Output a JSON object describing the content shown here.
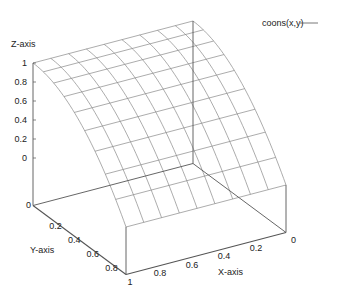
{
  "chart_data": {
    "type": "surface",
    "title": "",
    "xlabel": "X-axis",
    "ylabel": "Y-axis",
    "zlabel": "Z-axis",
    "legend": [
      {
        "name": "coons(x,y)",
        "style": "line",
        "color": "#333333"
      }
    ],
    "legend_position": "top-right",
    "xlim": [
      0,
      1
    ],
    "ylim": [
      0,
      1
    ],
    "zlim": [
      -0.5,
      1
    ],
    "x_ticks": [
      "0",
      "0.2",
      "0.4",
      "0.6",
      "0.8",
      "1"
    ],
    "y_ticks": [
      "0",
      "0.2",
      "0.4",
      "0.6",
      "0.8",
      "1"
    ],
    "z_ticks": [
      "0",
      "0.2",
      "0.4",
      "0.6",
      "0.8",
      "1"
    ],
    "grid_resolution": 10,
    "function_description": "z = 1 - y^2 (constant along x)",
    "sample_points": [
      {
        "y": 0.0,
        "z": 1.0
      },
      {
        "y": 0.2,
        "z": 0.96
      },
      {
        "y": 0.4,
        "z": 0.84
      },
      {
        "y": 0.6,
        "z": 0.64
      },
      {
        "y": 0.8,
        "z": 0.36
      },
      {
        "y": 1.0,
        "z": 0.0
      }
    ],
    "grid": false,
    "line_color": "#888888",
    "axis_color": "#555555"
  }
}
